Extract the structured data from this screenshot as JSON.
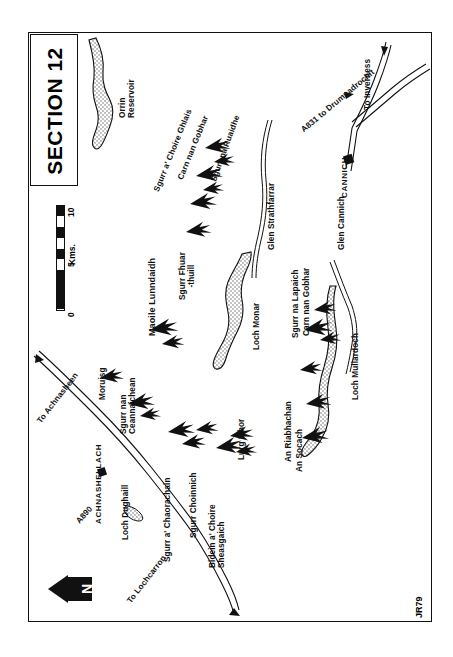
{
  "plate": {
    "title": "SECTION 12",
    "signature": "JR79"
  },
  "scale": {
    "unit_label": "Kms.",
    "ticks": [
      "0",
      "5",
      "10"
    ]
  },
  "compass": {
    "label": "N",
    "name": "north-arrow"
  },
  "features": {
    "mountains": [
      {
        "name": "Moruisg"
      },
      {
        "name": "Sgurr nan Ceannaichean"
      },
      {
        "name": "Maoile Lunndaidh"
      },
      {
        "name": "Sgurr a' Chaorachain"
      },
      {
        "name": "Sgurr Choinnich"
      },
      {
        "name": "Bidein a' Choire Sheasgaich"
      },
      {
        "name": "Lurg Mhor"
      },
      {
        "name": "Sgurr Fhuar-thuill"
      },
      {
        "name": "Sgurr a' Choire Ghlais"
      },
      {
        "name": "Carn nan Gobhar"
      },
      {
        "name": "Sgurr na Ruaidhe"
      },
      {
        "name": "An Socach"
      },
      {
        "name": "An Riabhachan"
      },
      {
        "name": "Sgurr na Lapaich"
      },
      {
        "name": "Carn nan Gobhar"
      }
    ],
    "water": [
      {
        "name": "Orrin Reservoir"
      },
      {
        "name": "Loch Monar"
      },
      {
        "name": "Loch Mullardoch"
      },
      {
        "name": "Loch Dughaill"
      }
    ],
    "glens": [
      {
        "name": "Glen Strathfarrar"
      },
      {
        "name": "Glen Cannich"
      }
    ],
    "settlements": [
      {
        "name": "ACHNASHELLACH"
      },
      {
        "name": "CANNICH"
      }
    ],
    "roads": [
      {
        "name": "A890"
      },
      {
        "name": "A831 to Drumnadrochit"
      },
      {
        "name": "To Achnasheen"
      },
      {
        "name": "To Lochcarron"
      },
      {
        "name": "To Inverness"
      }
    ]
  },
  "labels": {
    "orrin_reservoir": "Orrin\nReservoir",
    "sgurr_na_ruaidhe": "Sgurr na Ruaidhe",
    "carn_nan_gobhar_n": "Carn nan Gobhar",
    "sgurr_a_choire_ghlais": "Sgurr a' Choire Ghlais",
    "sgurr_fhuar_thuill": "Sgurr Fhuar\n-thuill",
    "glen_strathfarrar": "Glen Strathfarrar",
    "maoile_lunndaidh": "Maoile Lunndaidh",
    "moruisg": "Moruisg",
    "sgurr_nan_ceannaichean": "Sgurr nan\nCeannaichean",
    "achnashellach": "ACHNASHELLACH",
    "loch_dughaill": "Loch Dughaill",
    "sgurr_a_chaorachain": "Sgurr a' Chaorachain",
    "sgurr_choinnich": "Sgurr Choinnich",
    "bidein_a_choire_sheasgaich": "Bidein a' Choire\nSheasgaich",
    "lurg_mhor": "Lurg Mhor",
    "loch_monar": "Loch Monar",
    "an_socach": "An Socach",
    "an_riabhachan": "An Riabhachan",
    "sgurr_na_lapaich": "Sgurr na Lapaich",
    "carn_nan_gobhar_s": "Carn nan Gobhar",
    "loch_mullardoch": "Loch Mullardoch",
    "glen_cannich": "Glen Cannich",
    "cannich": "CANNICH",
    "a831": "A831 to Drumnadrochit",
    "to_inverness": "To Inverness",
    "a890": "A890",
    "to_achnasheen": "To Achnasheen",
    "to_lochcarron": "To Lochcarron"
  },
  "colors": {
    "ink": "#111111",
    "paper": "#ffffff",
    "water_fill": "#cfcfcf"
  }
}
